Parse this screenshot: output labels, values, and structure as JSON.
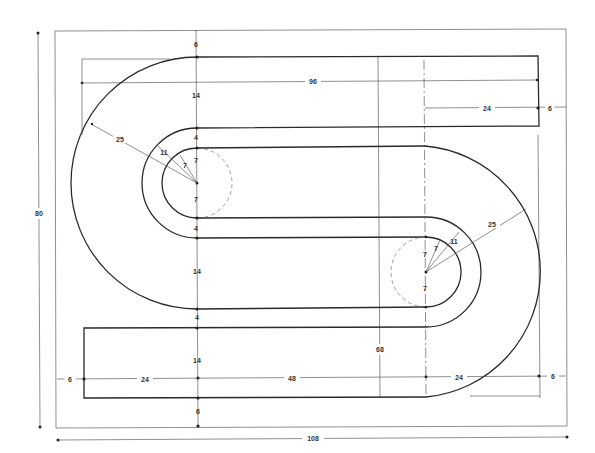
{
  "drawing": {
    "title": "S-shaped track layout dimension drawing",
    "units_note": "dimensions in units",
    "overall": {
      "width": "108",
      "height": "80",
      "inner_width": "96",
      "centers_distance": "68"
    },
    "vertical_stack_left": [
      "6",
      "14",
      "4",
      "7",
      "7",
      "4",
      "14",
      "4",
      "14",
      "6"
    ],
    "radii": {
      "outer": "25",
      "middle": "11",
      "inner": "7"
    },
    "top_bar": {
      "right_segment": "24",
      "right_margin": "6"
    },
    "bottom_row": {
      "left_margin": "6",
      "left_segment": "24",
      "middle_segment": "48",
      "right_segment": "24",
      "right_margin": "6"
    },
    "right_loop": {
      "outer": "25",
      "middle": "11",
      "inner_a": "7",
      "inner_b": "7",
      "lower": "7"
    }
  }
}
